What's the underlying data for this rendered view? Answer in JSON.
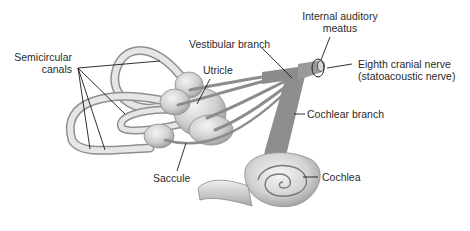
{
  "diagram": {
    "labels": {
      "semicircular_canals_line1": "Semicircular",
      "semicircular_canals_line2": "canals",
      "vestibular_branch": "Vestibular branch",
      "utricle": "Utricle",
      "internal_auditory_meatus_line1": "Internal auditory",
      "internal_auditory_meatus_line2": "meatus",
      "eighth_cranial_nerve_line1": "Eighth cranial nerve",
      "eighth_cranial_nerve_line2": "(statoacoustic nerve)",
      "cochlear_branch": "Cochlear branch",
      "saccule": "Saccule",
      "cochlea": "Cochlea"
    },
    "colors": {
      "structure_fill": "#d9d9d9",
      "structure_highlight": "#f2f2f2",
      "structure_outline": "#8a8a8a",
      "nerve": "#8c8c8c",
      "leader_line": "#1a1a1a",
      "text": "#2a2a2a"
    }
  }
}
